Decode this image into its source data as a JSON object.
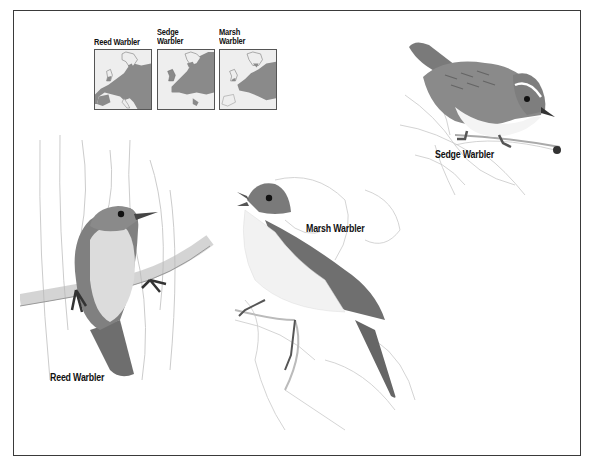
{
  "plate": {
    "frame_color": "#3a3a3a",
    "background": "#ffffff"
  },
  "range_maps": {
    "items": [
      {
        "label_line1": "Reed Warbler",
        "label_line2": "",
        "species": "reed-warbler",
        "range_fill": "#8a8a8a"
      },
      {
        "label_line1": "Sedge",
        "label_line2": "Warbler",
        "species": "sedge-warbler",
        "range_fill": "#8a8a8a"
      },
      {
        "label_line1": "Marsh",
        "label_line2": "Warbler",
        "species": "marsh-warbler",
        "range_fill": "#8a8a8a"
      }
    ]
  },
  "birds": {
    "reed": {
      "label": "Reed Warbler"
    },
    "marsh": {
      "label": "Marsh Warbler"
    },
    "sedge": {
      "label": "Sedge Warbler"
    }
  }
}
